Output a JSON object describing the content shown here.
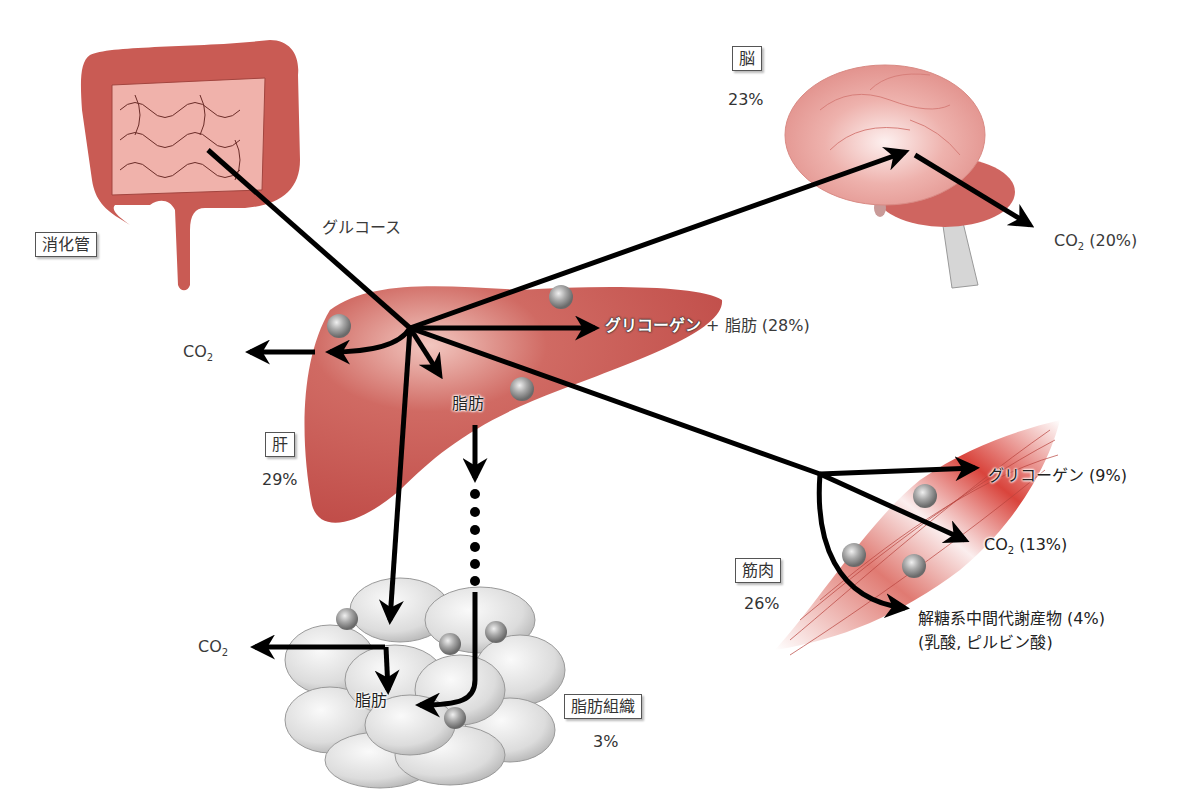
{
  "diagram": {
    "title": "",
    "input": {
      "source_label": "消化管",
      "flow_label": "グルコース"
    },
    "organs": {
      "brain": {
        "label": "脳",
        "percent": "23%",
        "outputs": [
          {
            "label": "CO2 (20%)",
            "co": "CO",
            "sub": "2",
            "rest": " (20%)"
          }
        ]
      },
      "liver": {
        "label": "肝",
        "percent": "29%",
        "outputs": {
          "glycogen_fat": {
            "main": "グリコーゲン",
            "rest": " + 脂肪 (28%)"
          },
          "co2": {
            "co": "CO",
            "sub": "2"
          },
          "fat": "脂肪"
        }
      },
      "muscle": {
        "label": "筋肉",
        "percent": "26%",
        "outputs": {
          "glycogen": "グリコーゲン (9%)",
          "co2": {
            "co": "CO",
            "sub": "2",
            "rest": " (13%)"
          },
          "glycolysis_line1": "解糖系中間代謝産物 (4%)",
          "glycolysis_line2": "(乳酸,  ピルビン酸)"
        }
      },
      "adipose": {
        "label": "脂肪組織",
        "percent": "3%",
        "outputs": {
          "co2": {
            "co": "CO",
            "sub": "2"
          },
          "fat": "脂肪"
        }
      }
    },
    "colors": {
      "organ_red": "#c85450",
      "organ_light": "#e9a09a",
      "brain_pink": "#eba3a1",
      "arrow": "#000000",
      "adipose_gray": "#d8d8d8",
      "sphere_gray": "#999999"
    }
  }
}
